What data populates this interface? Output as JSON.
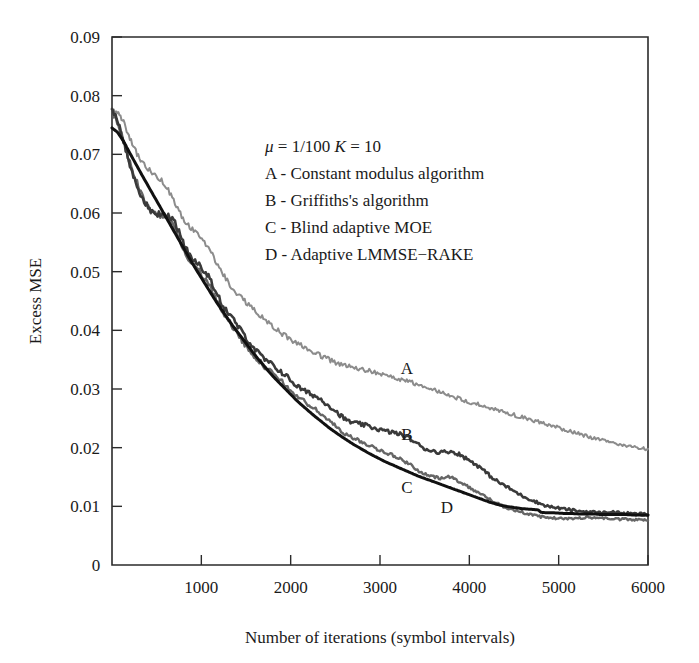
{
  "chart_data": {
    "type": "line",
    "title": "",
    "xlabel": "Number of iterations (symbol intervals)",
    "ylabel": "Excess MSE",
    "xlim": [
      0,
      6000
    ],
    "ylim": [
      0,
      0.09
    ],
    "grid": false,
    "legend_position": "inside-top-right",
    "x_ticks": [
      0,
      1000,
      2000,
      3000,
      4000,
      5000,
      6000
    ],
    "x_tick_labels": [
      "0",
      "1000",
      "2000",
      "3000",
      "4000",
      "5000",
      "6000"
    ],
    "y_ticks": [
      0,
      0.01,
      0.02,
      0.03,
      0.04,
      0.05,
      0.06,
      0.07,
      0.08,
      0.09
    ],
    "y_tick_labels": [
      "0",
      "0.01",
      "0.02",
      "0.03",
      "0.04",
      "0.05",
      "0.06",
      "0.07",
      "0.08",
      "0.09"
    ],
    "annotations": [
      {
        "text": "A",
        "x": 3300,
        "y": 0.0325
      },
      {
        "text": "B",
        "x": 3300,
        "y": 0.0213
      },
      {
        "text": "C",
        "x": 3300,
        "y": 0.0122
      },
      {
        "text": "D",
        "x": 3750,
        "y": 0.0088
      }
    ],
    "series": [
      {
        "name": "A",
        "label": "Constant modulus algorithm",
        "color": "#8c8c8c",
        "linewidth": 2.0,
        "x": [
          0,
          60,
          130,
          200,
          280,
          360,
          450,
          540,
          630,
          720,
          810,
          900,
          990,
          1080,
          1170,
          1260,
          1350,
          1440,
          1530,
          1620,
          1710,
          1800,
          1890,
          1980,
          2070,
          2160,
          2250,
          2340,
          2430,
          2520,
          2610,
          2700,
          2790,
          2880,
          2970,
          3060,
          3150,
          3240,
          3330,
          3420,
          3510,
          3600,
          3690,
          3780,
          3870,
          3960,
          4050,
          4140,
          4230,
          4320,
          4410,
          4500,
          4590,
          4680,
          4770,
          4860,
          4950,
          5040,
          5130,
          5220,
          5310,
          5400,
          5490,
          5580,
          5670,
          5760,
          5850,
          5940,
          6000
        ],
        "y": [
          0.0775,
          0.0772,
          0.0755,
          0.0728,
          0.07,
          0.0682,
          0.0668,
          0.0658,
          0.064,
          0.0612,
          0.0586,
          0.0572,
          0.056,
          0.054,
          0.0516,
          0.0492,
          0.047,
          0.0456,
          0.0444,
          0.043,
          0.0418,
          0.0406,
          0.0396,
          0.0386,
          0.0378,
          0.0372,
          0.0364,
          0.0356,
          0.035,
          0.0344,
          0.034,
          0.0336,
          0.0334,
          0.0331,
          0.0328,
          0.0324,
          0.032,
          0.0316,
          0.0312,
          0.0308,
          0.0303,
          0.0298,
          0.0294,
          0.0289,
          0.0284,
          0.028,
          0.0276,
          0.0272,
          0.0268,
          0.0264,
          0.026,
          0.0256,
          0.0252,
          0.0248,
          0.0244,
          0.024,
          0.0236,
          0.0232,
          0.0228,
          0.0224,
          0.022,
          0.0216,
          0.0213,
          0.0209,
          0.0206,
          0.0203,
          0.0201,
          0.0199,
          0.0198
        ]
      },
      {
        "name": "B",
        "label": "Griffiths's algorithm",
        "color": "#3a3a3a",
        "linewidth": 2.6,
        "x": [
          0,
          60,
          130,
          200,
          280,
          360,
          450,
          540,
          630,
          720,
          810,
          900,
          990,
          1080,
          1170,
          1260,
          1350,
          1440,
          1530,
          1620,
          1710,
          1800,
          1890,
          1980,
          2070,
          2160,
          2250,
          2340,
          2430,
          2520,
          2610,
          2700,
          2790,
          2880,
          2970,
          3060,
          3150,
          3240,
          3330,
          3420,
          3510,
          3600,
          3690,
          3780,
          3870,
          3960,
          4050,
          4140,
          4230,
          4320,
          4410,
          4500,
          4590,
          4680,
          4770,
          4860,
          4950,
          5040,
          5130,
          5220,
          5310,
          5400,
          5490,
          5580,
          5670,
          5760,
          5850,
          5940,
          6000
        ],
        "y": [
          0.0778,
          0.076,
          0.072,
          0.0682,
          0.0648,
          0.0618,
          0.0602,
          0.0598,
          0.0596,
          0.058,
          0.0545,
          0.052,
          0.051,
          0.0492,
          0.0462,
          0.0438,
          0.042,
          0.04,
          0.0382,
          0.0364,
          0.035,
          0.034,
          0.033,
          0.0318,
          0.0305,
          0.0296,
          0.029,
          0.0282,
          0.0272,
          0.026,
          0.0248,
          0.0242,
          0.024,
          0.0236,
          0.0232,
          0.0228,
          0.0226,
          0.0222,
          0.0216,
          0.0206,
          0.0198,
          0.0194,
          0.0192,
          0.0194,
          0.019,
          0.0182,
          0.0174,
          0.0164,
          0.0152,
          0.0142,
          0.0134,
          0.0126,
          0.0118,
          0.0112,
          0.0106,
          0.0101,
          0.0098,
          0.0096,
          0.0094,
          0.0092,
          0.0091,
          0.009,
          0.0089,
          0.0091,
          0.0089,
          0.0088,
          0.0087,
          0.0087,
          0.0086
        ]
      },
      {
        "name": "C",
        "label": "Blind adaptive MOE",
        "color": "#666666",
        "linewidth": 2.4,
        "x": [
          0,
          60,
          130,
          200,
          280,
          360,
          450,
          540,
          630,
          720,
          810,
          900,
          990,
          1080,
          1170,
          1260,
          1350,
          1440,
          1530,
          1620,
          1710,
          1800,
          1890,
          1980,
          2070,
          2160,
          2250,
          2340,
          2430,
          2520,
          2610,
          2700,
          2790,
          2880,
          2970,
          3060,
          3150,
          3240,
          3330,
          3420,
          3510,
          3600,
          3690,
          3780,
          3870,
          3960,
          4050,
          4140,
          4230,
          4320,
          4410,
          4500,
          4590,
          4680,
          4770,
          4860,
          4950,
          5040,
          5130,
          5220,
          5310,
          5400,
          5490,
          5580,
          5670,
          5760,
          5850,
          5940,
          6000
        ],
        "y": [
          0.0772,
          0.0756,
          0.0722,
          0.0686,
          0.0652,
          0.0622,
          0.06,
          0.0596,
          0.0592,
          0.057,
          0.0534,
          0.0512,
          0.0498,
          0.0478,
          0.0452,
          0.0428,
          0.0406,
          0.0386,
          0.0368,
          0.0352,
          0.0338,
          0.0326,
          0.0314,
          0.03,
          0.0288,
          0.0278,
          0.0268,
          0.0258,
          0.0246,
          0.0234,
          0.0224,
          0.0216,
          0.021,
          0.0204,
          0.0198,
          0.0192,
          0.0186,
          0.018,
          0.0172,
          0.0162,
          0.0154,
          0.015,
          0.0148,
          0.015,
          0.0144,
          0.0136,
          0.0128,
          0.012,
          0.0112,
          0.0104,
          0.0098,
          0.0094,
          0.009,
          0.0086,
          0.0083,
          0.0081,
          0.008,
          0.0079,
          0.0079,
          0.008,
          0.0081,
          0.0081,
          0.008,
          0.0079,
          0.0078,
          0.0078,
          0.0077,
          0.0077,
          0.0076
        ]
      },
      {
        "name": "D",
        "label": "Adaptive LMMSE-RAKE",
        "color": "#111111",
        "linewidth": 3.0,
        "x": [
          0,
          60,
          130,
          200,
          280,
          360,
          450,
          540,
          630,
          720,
          810,
          900,
          990,
          1080,
          1170,
          1260,
          1350,
          1440,
          1530,
          1620,
          1710,
          1800,
          1890,
          1980,
          2070,
          2160,
          2250,
          2340,
          2430,
          2520,
          2610,
          2700,
          2790,
          2880,
          2970,
          3060,
          3150,
          3240,
          3330,
          3420,
          3510,
          3600,
          3690,
          3780,
          3870,
          3960,
          4050,
          4140,
          4230,
          4320,
          4410,
          4500,
          4590,
          4680,
          4770,
          4800,
          4860,
          4950,
          5040,
          5130,
          5220,
          5310,
          5400,
          5490,
          5580,
          5670,
          5760,
          5850,
          5940,
          6000
        ],
        "y": [
          0.0745,
          0.0738,
          0.0722,
          0.0702,
          0.068,
          0.0658,
          0.0634,
          0.061,
          0.0586,
          0.0562,
          0.0538,
          0.0514,
          0.0492,
          0.047,
          0.0448,
          0.0428,
          0.0408,
          0.039,
          0.0372,
          0.0354,
          0.0338,
          0.0322,
          0.0308,
          0.0294,
          0.028,
          0.0268,
          0.0256,
          0.0245,
          0.0234,
          0.0224,
          0.0215,
          0.0206,
          0.0198,
          0.019,
          0.0183,
          0.0176,
          0.017,
          0.0164,
          0.0158,
          0.0152,
          0.0147,
          0.0142,
          0.0137,
          0.0132,
          0.0127,
          0.0122,
          0.0117,
          0.0112,
          0.0107,
          0.0103,
          0.01,
          0.0098,
          0.0096,
          0.0095,
          0.0094,
          0.009,
          0.0089,
          0.0089,
          0.0088,
          0.0088,
          0.0087,
          0.0087,
          0.0087,
          0.0086,
          0.0086,
          0.0086,
          0.0086,
          0.0085,
          0.0085,
          0.0085
        ]
      }
    ]
  },
  "legend": {
    "params_mu_symbol": "μ",
    "params_line": "μ = 1/100  K = 10",
    "params_mu_eq": " = 1/100  ",
    "params_k_symbol": "K",
    "params_k_eq": " = 10",
    "entries": [
      {
        "key": "A",
        "text": "A - Constant modulus algorithm"
      },
      {
        "key": "B",
        "text": "B - Griffiths's algorithm"
      },
      {
        "key": "C",
        "text": "C - Blind adaptive MOE"
      },
      {
        "key": "D",
        "text": "D - Adaptive LMMSE−RAKE"
      }
    ]
  },
  "axes": {
    "x_title": "Number of iterations (symbol intervals)",
    "y_title": "Excess MSE",
    "x_tick_labels": [
      "0",
      "1000",
      "2000",
      "3000",
      "4000",
      "5000",
      "6000"
    ],
    "y_tick_labels": [
      "0",
      "0.01",
      "0.02",
      "0.03",
      "0.04",
      "0.05",
      "0.06",
      "0.07",
      "0.08",
      "0.09"
    ]
  },
  "curve_tags": [
    {
      "label": "A"
    },
    {
      "label": "B"
    },
    {
      "label": "C"
    },
    {
      "label": "D"
    }
  ],
  "colors": {
    "series_a": "#8c8c8c",
    "series_b": "#3a3a3a",
    "series_c": "#666666",
    "series_d": "#111111",
    "frame": "#2b2b2b",
    "text": "#1a1a1a",
    "background": "#ffffff"
  }
}
